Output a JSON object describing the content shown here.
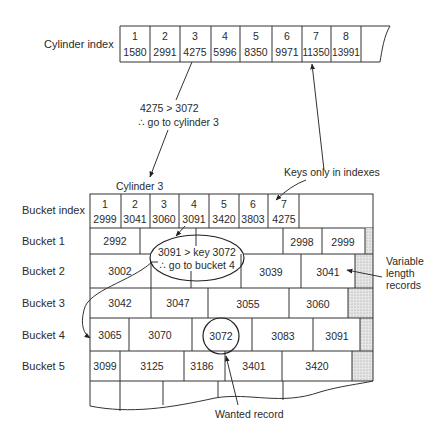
{
  "cylinder_index": {
    "label": "Cylinder index",
    "cells": [
      {
        "n": "1",
        "key": "1580"
      },
      {
        "n": "2",
        "key": "2991"
      },
      {
        "n": "3",
        "key": "4275"
      },
      {
        "n": "4",
        "key": "5996"
      },
      {
        "n": "5",
        "key": "8350"
      },
      {
        "n": "6",
        "key": "9971"
      },
      {
        "n": "7",
        "key": "11350"
      },
      {
        "n": "8",
        "key": "13991"
      }
    ]
  },
  "annotations": {
    "cyl_compare": "4275 > 3072",
    "cyl_goto": "∴ go to cylinder 3",
    "cylinder_title": "Cylinder 3",
    "keys_only": "Keys only in indexes",
    "bucket_compare": "3091 > key 3072",
    "bucket_goto": "∴ go to bucket 4",
    "variable_1": "Variable",
    "variable_2": "length",
    "variable_3": "records",
    "wanted": "Wanted record"
  },
  "bucket_index": {
    "label": "Bucket index",
    "cells": [
      {
        "n": "1",
        "key": "2999"
      },
      {
        "n": "2",
        "key": "3041"
      },
      {
        "n": "3",
        "key": "3060"
      },
      {
        "n": "4",
        "key": "3091"
      },
      {
        "n": "5",
        "key": "3420"
      },
      {
        "n": "6",
        "key": "3803"
      },
      {
        "n": "7",
        "key": "4275"
      }
    ]
  },
  "buckets": [
    {
      "label": "Bucket 1",
      "records": [
        "2992",
        "2998",
        "2999"
      ]
    },
    {
      "label": "Bucket 2",
      "records": [
        "3002",
        "3039",
        "3041"
      ]
    },
    {
      "label": "Bucket 3",
      "records": [
        "3042",
        "3047",
        "3055",
        "3060"
      ]
    },
    {
      "label": "Bucket 4",
      "records": [
        "3065",
        "3070",
        "3072",
        "3083",
        "3091"
      ]
    },
    {
      "label": "Bucket 5",
      "records": [
        "3099",
        "3125",
        "3186",
        "3401",
        "3420"
      ]
    }
  ]
}
